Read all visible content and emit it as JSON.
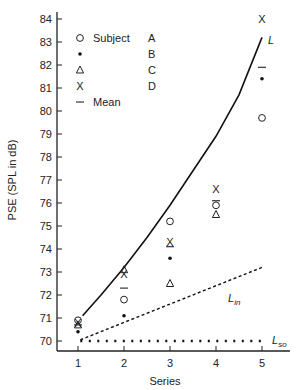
{
  "chart_data": {
    "type": "scatter",
    "title": "",
    "xlabel": "Series",
    "ylabel": "PSE (SPL in dB)",
    "xlim": [
      0.6,
      5.6
    ],
    "ylim": [
      69.6,
      84.2
    ],
    "x_ticks": [
      1,
      2,
      3,
      4,
      5
    ],
    "y_ticks": [
      70,
      71,
      72,
      73,
      74,
      75,
      76,
      77,
      78,
      79,
      80,
      81,
      82,
      83,
      84
    ],
    "grid": false,
    "legend": {
      "position": "top-left",
      "header": "Subject",
      "entries": [
        {
          "symbol": "circle",
          "label": "A"
        },
        {
          "symbol": "dot",
          "label": "B"
        },
        {
          "symbol": "triangle",
          "label": "C"
        },
        {
          "symbol": "x",
          "label": "D"
        },
        {
          "symbol": "dash",
          "label": "Mean"
        }
      ]
    },
    "x": [
      1,
      2,
      3,
      4,
      5
    ],
    "series": [
      {
        "name": "A",
        "symbol": "circle",
        "values": [
          70.9,
          71.8,
          75.2,
          75.9,
          79.7
        ]
      },
      {
        "name": "B",
        "symbol": "dot",
        "values": [
          70.4,
          71.1,
          73.6,
          null,
          81.4
        ]
      },
      {
        "name": "C",
        "symbol": "triangle",
        "values": [
          70.7,
          73.1,
          72.5,
          75.5,
          null
        ]
      },
      {
        "name": "D",
        "symbol": "x",
        "values": [
          70.8,
          72.9,
          74.3,
          76.6,
          84.0
        ]
      },
      {
        "name": "Mean",
        "symbol": "dash",
        "values": [
          70.7,
          72.3,
          74.1,
          76.1,
          81.9
        ]
      }
    ],
    "lines": [
      {
        "name": "L",
        "style": "solid",
        "x": [
          1.1,
          1.5,
          2,
          2.5,
          3,
          3.5,
          4,
          4.5,
          5
        ],
        "values": [
          71.1,
          72.0,
          73.2,
          74.5,
          75.9,
          77.4,
          78.9,
          80.7,
          83.2
        ]
      },
      {
        "name": "L_in",
        "style": "dashed",
        "x": [
          1.05,
          5
        ],
        "values": [
          70.05,
          73.2
        ]
      },
      {
        "name": "L_so",
        "style": "dotted",
        "x": [
          1.05,
          5
        ],
        "values": [
          70.0,
          70.0
        ]
      }
    ],
    "annotations": [
      {
        "text": "L",
        "x": 5.1,
        "y": 83.2
      },
      {
        "text": "L_in",
        "x": 4.4,
        "y": 71.9
      },
      {
        "text": "L_so",
        "x": 5.3,
        "y": 70.0
      }
    ]
  },
  "labels": {
    "line_L": "L",
    "line_Lin_main": "L",
    "line_Lin_sub": "in",
    "line_Lso_main": "L",
    "line_Lso_sub": "so",
    "legend_header": "Subject",
    "legend_mean": "Mean"
  }
}
